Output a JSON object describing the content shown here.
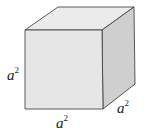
{
  "diagram": {
    "type": "cube",
    "colors": {
      "front_face": "#e6e6e6",
      "top_face": "#ebebeb",
      "right_face": "#cfcfcf",
      "edge": "#333333"
    },
    "labels": {
      "height": {
        "base": "a",
        "exponent": "2"
      },
      "width": {
        "base": "a",
        "exponent": "2"
      },
      "depth": {
        "base": "a",
        "exponent": "2"
      }
    }
  }
}
